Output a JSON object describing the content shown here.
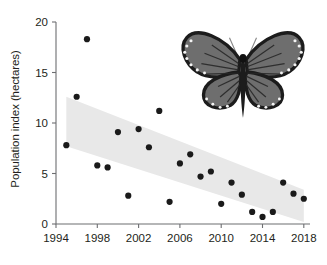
{
  "figure": {
    "ylabel": "Population index (hectares)",
    "dot_color": "#1a1a1a",
    "band_color": "#e8e8e8",
    "axis_color": "#6d6e71",
    "image_caption": "monarch-butterfly-photo"
  },
  "chart_data": {
    "type": "scatter",
    "title": "",
    "xlabel": "",
    "ylabel": "Population index (hectares)",
    "xlim": [
      1994,
      2018.6
    ],
    "ylim": [
      0,
      20
    ],
    "xticks": [
      1994,
      1998,
      2002,
      2006,
      2010,
      2014,
      2018
    ],
    "xtick_labels": [
      "1994",
      "1998",
      "2002",
      "2006",
      "2010",
      "2014",
      "2018"
    ],
    "yticks": [
      0,
      5,
      10,
      15,
      20
    ],
    "ytick_labels": [
      "0",
      "5",
      "10",
      "15",
      "20"
    ],
    "grid": false,
    "legend": false,
    "series": [
      {
        "name": "Population index",
        "x": [
          1995,
          1996,
          1997,
          1998,
          1999,
          2000,
          2001,
          2002,
          2003,
          2004,
          2005,
          2006,
          2007,
          2008,
          2009,
          2010,
          2011,
          2012,
          2013,
          2014,
          2015,
          2016,
          2017,
          2018
        ],
        "y": [
          7.8,
          12.6,
          18.3,
          5.8,
          5.6,
          9.1,
          2.8,
          9.4,
          7.6,
          11.2,
          2.2,
          6.0,
          6.9,
          4.7,
          5.2,
          2.0,
          4.1,
          2.9,
          1.2,
          0.7,
          1.2,
          4.1,
          3.0,
          2.5
        ]
      }
    ],
    "trend_band": {
      "name": "regression confidence band",
      "x": [
        1995,
        2018
      ],
      "upper": [
        12.6,
        3.4
      ],
      "lower": [
        7.7,
        0.2
      ]
    }
  }
}
